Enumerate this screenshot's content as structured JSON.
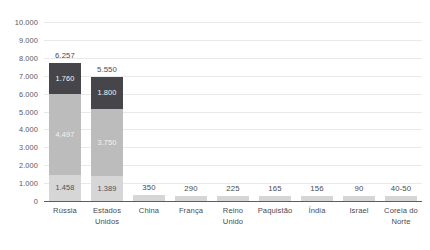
{
  "chart_data": {
    "type": "bar",
    "subtype": "stacked-bar",
    "title": "",
    "subtitle": "",
    "xlabel": "",
    "ylabel": "",
    "ylim": [
      0,
      10000
    ],
    "grid": true,
    "legend_position": "none",
    "y_ticks": [
      "0",
      "1.000",
      "2.000",
      "3.000",
      "4.000",
      "5.000",
      "6.000",
      "7.000",
      "8.000",
      "9.000",
      "10.000"
    ],
    "y_tick_values": [
      0,
      1000,
      2000,
      3000,
      4000,
      5000,
      6000,
      7000,
      8000,
      9000,
      10000
    ],
    "categories": [
      "Rússia",
      "Estados Unidos",
      "China",
      "França",
      "Reino Unido",
      "Paquistão",
      "Índia",
      "Israel",
      "Coreia do Norte"
    ],
    "totals": [
      6257,
      5550,
      350,
      290,
      225,
      165,
      156,
      90,
      45
    ],
    "total_labels": [
      "6.257",
      "5.550",
      "350",
      "290",
      "225",
      "165",
      "156",
      "90",
      "40-50"
    ],
    "series": [
      {
        "name": "bottom-segment",
        "color": "#d6d6d7",
        "values": [
          1458,
          1389,
          350,
          290,
          225,
          165,
          156,
          90,
          45
        ],
        "labels": [
          "1.458",
          "1.389",
          "",
          "",
          "",
          "",
          "",
          "",
          ""
        ]
      },
      {
        "name": "middle-segment",
        "color": "#bcbcbd",
        "values": [
          4497,
          3750,
          0,
          0,
          0,
          0,
          0,
          0,
          0
        ],
        "labels": [
          "4.497",
          "3.750",
          "",
          "",
          "",
          "",
          "",
          "",
          ""
        ]
      },
      {
        "name": "top-segment",
        "color": "#46464a",
        "values": [
          1760,
          1800,
          0,
          0,
          0,
          0,
          0,
          0,
          0
        ],
        "labels": [
          "1.760",
          "1.800",
          "",
          "",
          "",
          "",
          "",
          "",
          ""
        ]
      }
    ],
    "colors": {
      "bottom": "#d6d6d7",
      "middle": "#bcbcbd",
      "top": "#46464a",
      "gridline": "#e9e9ea",
      "axis": "#5d5d60",
      "text": "#4b4b4e"
    }
  }
}
